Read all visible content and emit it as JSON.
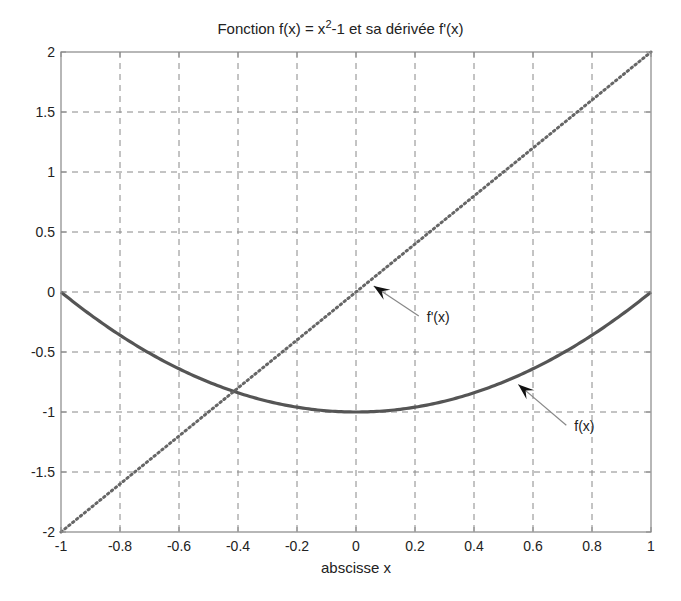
{
  "chart_data": {
    "type": "line",
    "title_parts": {
      "pre": "Fonction f(x) = x",
      "sup": "2",
      "post": "-1 et sa dérivée f'(x)"
    },
    "xlabel": "abscisse x",
    "ylabel": "",
    "xlim": [
      -1,
      1
    ],
    "ylim": [
      -2,
      2
    ],
    "grid": true,
    "legend": null,
    "x_ticks": [
      -1,
      -0.8,
      -0.6,
      -0.4,
      -0.2,
      0,
      0.2,
      0.4,
      0.6,
      0.8,
      1
    ],
    "x_tick_labels": [
      "-1",
      "-0.8",
      "-0.6",
      "-0.4",
      "-0.2",
      "0",
      "0.2",
      "0.4",
      "0.6",
      "0.8",
      "1"
    ],
    "y_ticks": [
      -2,
      -1.5,
      -1,
      -0.5,
      0,
      0.5,
      1,
      1.5,
      2
    ],
    "y_tick_labels": [
      "-2",
      "-1.5",
      "-1",
      "-0.5",
      "0",
      "0.5",
      "1",
      "1.5",
      "2"
    ],
    "series": [
      {
        "name": "f(x)",
        "expression": "x^2-1",
        "style": "solid",
        "color": "#555555",
        "x": [
          -1,
          -0.8,
          -0.6,
          -0.4,
          -0.2,
          0,
          0.2,
          0.4,
          0.6,
          0.8,
          1
        ],
        "y": [
          0,
          -0.36,
          -0.64,
          -0.84,
          -0.96,
          -1,
          -0.96,
          -0.84,
          -0.64,
          -0.36,
          0
        ]
      },
      {
        "name": "f'(x)",
        "expression": "2x",
        "style": "dotted",
        "color": "#666666",
        "x": [
          -1,
          -0.8,
          -0.6,
          -0.4,
          -0.2,
          0,
          0.2,
          0.4,
          0.6,
          0.8,
          1
        ],
        "y": [
          -2,
          -1.6,
          -1.2,
          -0.8,
          -0.4,
          0,
          0.4,
          0.8,
          1.2,
          1.6,
          2
        ]
      }
    ],
    "annotations": [
      {
        "text": "f'(x)",
        "arrow_tip": [
          0.06,
          0.05
        ],
        "text_pos": [
          0.24,
          -0.25
        ]
      },
      {
        "text": "f(x)",
        "arrow_tip": [
          0.55,
          -0.77
        ],
        "text_pos": [
          0.74,
          -1.16
        ]
      }
    ]
  },
  "colors": {
    "axes": "#888888",
    "grid": "#888888",
    "curve": "#555555",
    "derivative": "#666666",
    "arrow": "#888888"
  }
}
